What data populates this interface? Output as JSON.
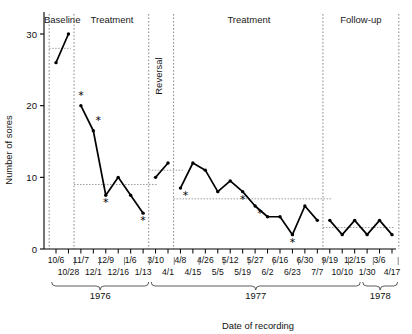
{
  "chart_data": {
    "type": "line",
    "title": "",
    "xlabel": "Date of recording",
    "ylabel": "Number of sores",
    "ylim": [
      0,
      32
    ],
    "yticks": [
      0,
      10,
      20,
      30
    ],
    "ytick_labels": [
      "0",
      "10",
      "20",
      "30"
    ],
    "grid": false,
    "legend": null,
    "x_tick_labels": [
      "10/6",
      "10/28",
      "11/7",
      "12/1",
      "12/9",
      "12/16",
      "1/6",
      "1/13",
      "3/10",
      "4/1",
      "4/8",
      "4/15",
      "4/26",
      "5/5",
      "5/12",
      "5/19",
      "5/27",
      "6/2",
      "6/16",
      "6/23",
      "6/30",
      "7/7",
      "9/19",
      "10/10",
      "12/15",
      "1/30",
      "3/6",
      "4/17"
    ],
    "x_tick_rows": {
      "upper": [
        "10/6",
        "11/7",
        "12/9",
        "1/6",
        "3/10",
        "4/8",
        "4/26",
        "5/12",
        "5/27",
        "6/16",
        "6/30",
        "9/19",
        "12/15",
        "3/6"
      ],
      "lower": [
        "10/28",
        "12/1",
        "12/16",
        "1/13",
        "4/1",
        "4/15",
        "5/5",
        "5/19",
        "6/2",
        "6/23",
        "7/7",
        "10/10",
        "1/30",
        "4/17"
      ]
    },
    "year_brackets": [
      {
        "label": "1976",
        "from": "10/6",
        "to": "1/13"
      },
      {
        "label": "1977",
        "from": "3/10",
        "to": "12/15"
      },
      {
        "label": "1978",
        "from": "1/30",
        "to": "4/17"
      }
    ],
    "phases": [
      {
        "name": "Baseline",
        "label": "Baseline",
        "orientation": "horizontal",
        "start_index": 0,
        "end_index": 1
      },
      {
        "name": "Treatment1",
        "label": "Treatment",
        "orientation": "horizontal",
        "start_index": 2,
        "end_index": 7
      },
      {
        "name": "Reversal",
        "label": "Reversal",
        "orientation": "vertical",
        "start_index": 8,
        "end_index": 9
      },
      {
        "name": "Treatment2",
        "label": "Treatment",
        "orientation": "horizontal",
        "start_index": 10,
        "end_index": 21
      },
      {
        "name": "Follow-up",
        "label": "Follow-up",
        "orientation": "horizontal",
        "start_index": 22,
        "end_index": 27
      }
    ],
    "series": [
      {
        "name": "Number of sores",
        "points": [
          {
            "x": "10/6",
            "y": 26,
            "phase": "Baseline",
            "star": false
          },
          {
            "x": "10/28",
            "y": 30,
            "phase": "Baseline",
            "star": false
          },
          {
            "x": "11/7",
            "y": 20,
            "phase": "Treatment1",
            "star": true
          },
          {
            "x": "12/1",
            "y": 16.5,
            "phase": "Treatment1",
            "star": true
          },
          {
            "x": "12/9",
            "y": 7.5,
            "phase": "Treatment1",
            "star": true
          },
          {
            "x": "12/16",
            "y": 10,
            "phase": "Treatment1",
            "star": false
          },
          {
            "x": "1/6",
            "y": 7.5,
            "phase": "Treatment1",
            "star": false
          },
          {
            "x": "1/13",
            "y": 5,
            "phase": "Treatment1",
            "star": true
          },
          {
            "x": "3/10",
            "y": 10,
            "phase": "Reversal",
            "star": false
          },
          {
            "x": "4/1",
            "y": 12,
            "phase": "Reversal",
            "star": false
          },
          {
            "x": "4/8",
            "y": 8.5,
            "phase": "Treatment2",
            "star": true
          },
          {
            "x": "4/15",
            "y": 12,
            "phase": "Treatment2",
            "star": false
          },
          {
            "x": "4/26",
            "y": 11,
            "phase": "Treatment2",
            "star": false
          },
          {
            "x": "5/5",
            "y": 8,
            "phase": "Treatment2",
            "star": false
          },
          {
            "x": "5/12",
            "y": 9.5,
            "phase": "Treatment2",
            "star": false
          },
          {
            "x": "5/19",
            "y": 8,
            "phase": "Treatment2",
            "star": true
          },
          {
            "x": "5/27",
            "y": 6,
            "phase": "Treatment2",
            "star": true
          },
          {
            "x": "6/2",
            "y": 4.5,
            "phase": "Treatment2",
            "star": false
          },
          {
            "x": "6/16",
            "y": 4.5,
            "phase": "Treatment2",
            "star": false
          },
          {
            "x": "6/23",
            "y": 2,
            "phase": "Treatment2",
            "star": true
          },
          {
            "x": "6/30",
            "y": 6,
            "phase": "Treatment2",
            "star": false
          },
          {
            "x": "7/7",
            "y": 4,
            "phase": "Treatment2",
            "star": false
          },
          {
            "x": "9/19",
            "y": 4,
            "phase": "Follow-up",
            "star": false
          },
          {
            "x": "10/10",
            "y": 2,
            "phase": "Follow-up",
            "star": false
          },
          {
            "x": "12/15",
            "y": 4,
            "phase": "Follow-up",
            "star": false
          },
          {
            "x": "1/30",
            "y": 2,
            "phase": "Follow-up",
            "star": false
          },
          {
            "x": "3/6",
            "y": 4,
            "phase": "Follow-up",
            "star": false
          },
          {
            "x": "4/17",
            "y": 2,
            "phase": "Follow-up",
            "star": false
          }
        ]
      }
    ],
    "reference_lines": [
      {
        "label": "baseline-mean",
        "y": 28,
        "from_index": 0,
        "to_index": 1,
        "style": "dotted"
      },
      {
        "label": "treatment1-mean",
        "y": 9,
        "from_index": 2,
        "to_index": 8,
        "style": "dotted"
      },
      {
        "label": "reversal-mean",
        "y": 11,
        "from_index": 8,
        "to_index": 10,
        "style": "dotted"
      },
      {
        "label": "treatment2-mean",
        "y": 7,
        "from_index": 10,
        "to_index": 22,
        "style": "dotted"
      },
      {
        "label": "followup-mean",
        "y": 3,
        "from_index": 22,
        "to_index": 27,
        "style": "dotted"
      }
    ],
    "annotations": {
      "star_symbol": "*",
      "star_meaning": "marked observation"
    }
  },
  "colors": {
    "line": "#000000",
    "axis": "#000000",
    "divider": "#7a7a7a",
    "reference": "#8c8c8c",
    "background": "#ffffff"
  }
}
